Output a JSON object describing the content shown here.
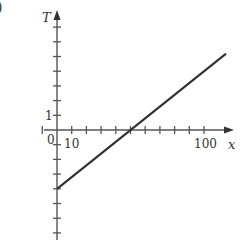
{
  "panel_label": ")",
  "chart_data": {
    "type": "line",
    "title": "",
    "xlabel": "x",
    "ylabel": "T",
    "x_tick_labels": [
      {
        "value": 0,
        "label": "0"
      },
      {
        "value": 10,
        "label": "10"
      },
      {
        "value": 100,
        "label": "100"
      }
    ],
    "y_tick_labels": [
      {
        "value": 1,
        "label": "1"
      }
    ],
    "x_tick_step": 10,
    "y_tick_step": 1,
    "xlim": [
      -5,
      115
    ],
    "ylim": [
      -8,
      8
    ],
    "grid": false,
    "legend": null,
    "series": [
      {
        "name": "T(x)",
        "x": [
          0,
          115
        ],
        "y": [
          -4,
          5.2
        ],
        "color": "#333333"
      }
    ],
    "annotations": [
      {
        "note": "line crosses x-axis at x = 50"
      }
    ]
  },
  "labels": {
    "origin": "0",
    "x_ten": "10",
    "x_hundred": "100",
    "y_one": "1",
    "x_axis": "x",
    "y_axis": "T"
  }
}
